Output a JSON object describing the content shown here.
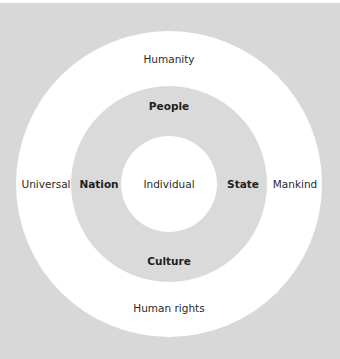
{
  "diagram": {
    "type": "concentric-circles",
    "center": {
      "x": 169,
      "y": 184
    },
    "colors": {
      "background": "#d8d8d8",
      "outer_ring": "#ffffff",
      "middle_ring": "#dadada",
      "inner_circle": "#ffffff"
    },
    "rings": {
      "outer": {
        "radius": 153,
        "labels": {
          "top": "Humanity",
          "left": "Universal",
          "right": "Mankind",
          "bottom": "Human rights"
        }
      },
      "middle": {
        "radius": 98,
        "labels": {
          "top": "People",
          "left": "Nation",
          "right": "State",
          "bottom": "Culture"
        }
      },
      "inner": {
        "radius": 48,
        "labels": {
          "center": "Individual"
        }
      }
    }
  }
}
